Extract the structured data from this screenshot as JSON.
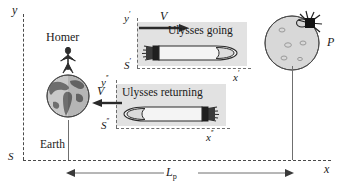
{
  "axes": {
    "y_label": "y",
    "x_label": "x",
    "origin_label": "S",
    "y_prime_label": "y",
    "y_prime_sup": "′",
    "x_prime_label": "x",
    "x_prime_sup": "′",
    "s_prime_label": "S",
    "s_prime_sup": "′",
    "y_dprime_label": "y",
    "y_dprime_sup": "′′",
    "x_dprime_label": "x",
    "x_dprime_sup": "′′",
    "s_dprime_label": "S",
    "s_dprime_sup": "′′"
  },
  "objects": {
    "homer_label": "Homer",
    "earth_label": "Earth",
    "planet_label": "P",
    "rocket_going_label": "Ulysses going",
    "rocket_returning_label": "Ulysses returning"
  },
  "velocity": {
    "going_label": "V",
    "returning_label": "V"
  },
  "dimension": {
    "label": "L",
    "subscript": "p"
  },
  "colors": {
    "frame_fill": "#e2e2e2",
    "planet_fill": "#d6d6d6",
    "earth_ocean": "#c9c9c9",
    "earth_land": "#6b6b6b",
    "rocket_fill": "#f2f2f2",
    "ink": "#1a1a1a",
    "dash": "#4a4a4a"
  }
}
